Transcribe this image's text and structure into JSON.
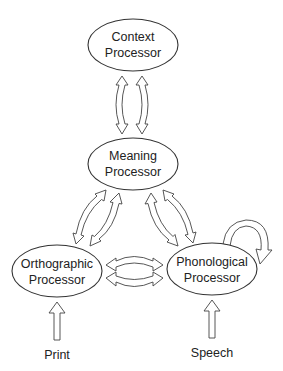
{
  "diagram": {
    "type": "reading-model",
    "nodes": [
      {
        "id": "context",
        "line1": "Context",
        "line2": "Processor",
        "cx": 133,
        "cy": 45
      },
      {
        "id": "meaning",
        "line1": "Meaning",
        "line2": "Processor",
        "cx": 133,
        "cy": 164
      },
      {
        "id": "orthographic",
        "line1": "Orthographic",
        "line2": "Processor",
        "cx": 57,
        "cy": 271
      },
      {
        "id": "phonological",
        "line1": "Phonological",
        "line2": "Processor",
        "cx": 212,
        "cy": 269
      }
    ],
    "inputs": [
      {
        "id": "print",
        "label": "Print",
        "target": "orthographic"
      },
      {
        "id": "speech",
        "label": "Speech",
        "target": "phonological"
      }
    ],
    "edges": [
      {
        "from": "context",
        "to": "meaning",
        "type": "bidirectional-pair"
      },
      {
        "from": "meaning",
        "to": "orthographic",
        "type": "bidirectional-pair"
      },
      {
        "from": "meaning",
        "to": "phonological",
        "type": "bidirectional-pair"
      },
      {
        "from": "orthographic",
        "to": "phonological",
        "type": "bidirectional-pair"
      },
      {
        "from": "phonological",
        "to": "phonological",
        "type": "self-loop"
      },
      {
        "from": "print",
        "to": "orthographic",
        "type": "input"
      },
      {
        "from": "speech",
        "to": "phonological",
        "type": "input"
      }
    ]
  }
}
